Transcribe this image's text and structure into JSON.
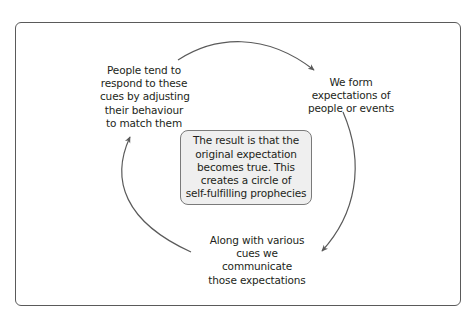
{
  "diagram": {
    "type": "cycle",
    "title": "",
    "colors": {
      "frame_border": "#5a5a5a",
      "arrow": "#5a5a5a",
      "center_fill": "#efefef",
      "center_border": "#7a7a7a",
      "text": "#231f20"
    },
    "nodes": {
      "right": {
        "lines": [
          "We form",
          "expectations of",
          "people or events"
        ]
      },
      "bottom": {
        "lines": [
          "Along with various",
          "cues we",
          "communicate",
          "those expectations"
        ]
      },
      "left": {
        "lines": [
          "People tend to",
          "respond to these",
          "cues by adjusting",
          "their behaviour",
          "to match them"
        ]
      }
    },
    "center": {
      "lines": [
        "The result is that the",
        "original expectation",
        "becomes true. This",
        "creates a circle of",
        "self-fulfilling prophecies"
      ]
    },
    "edges": [
      {
        "from": "left",
        "to": "right",
        "label": ""
      },
      {
        "from": "right",
        "to": "bottom",
        "label": ""
      },
      {
        "from": "bottom",
        "to": "left",
        "label": ""
      }
    ]
  }
}
